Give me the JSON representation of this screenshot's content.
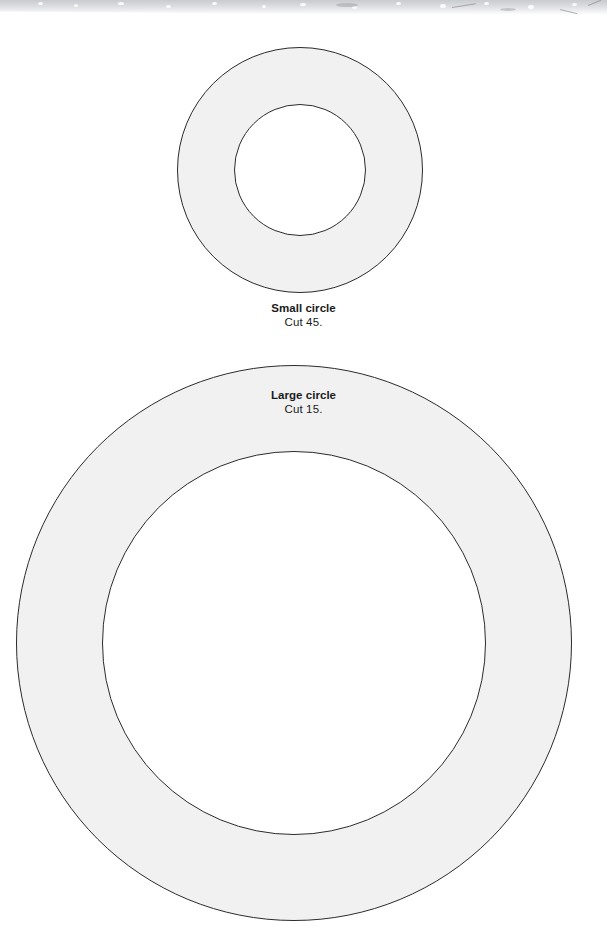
{
  "page": {
    "background_color": "#ffffff",
    "width": 607,
    "height": 936,
    "kind": "printable pattern template sheet"
  },
  "scan_artifact": {
    "name": "scanned-page-top-edge",
    "color": "#c8cacd",
    "description": "grey scanner bed shadow strip across the top of the page"
  },
  "shapes": {
    "fill_color": "#f1f1f1",
    "stroke_color": "#2b2b2b",
    "stroke_width": 1
  },
  "figures": [
    {
      "id": "small-circle",
      "title": "Small circle",
      "instruction": "Cut 45.",
      "outer_radius": 123,
      "inner_radius": 66,
      "center_x": 300,
      "center_y": 170
    },
    {
      "id": "large-circle",
      "title": "Large circle",
      "instruction": "Cut 15.",
      "outer_radius": 278,
      "inner_radius": 192,
      "center_x": 294,
      "center_y": 643
    }
  ]
}
